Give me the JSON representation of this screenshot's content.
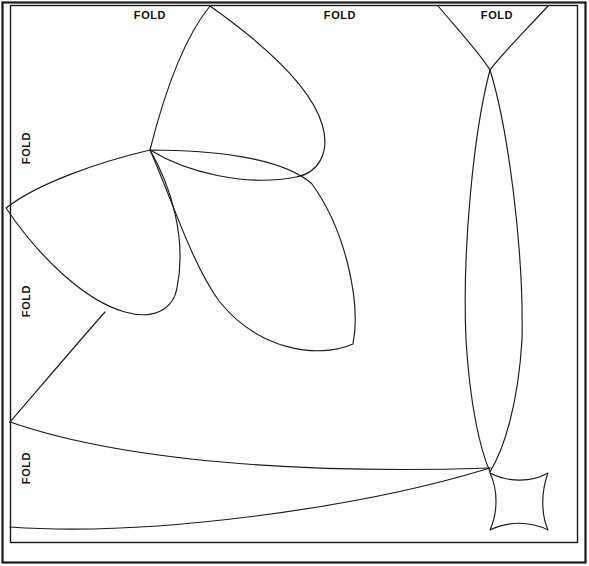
{
  "document": {
    "type": "quilt-applique-pattern-template",
    "title": "Folded pattern placement guide",
    "background_color": "#ffffff",
    "line_color": "#1a1a1a",
    "line_width": 1.1
  },
  "frame": {
    "outer": {
      "x": 2,
      "y": 2,
      "width": 584,
      "height": 561
    },
    "inner": {
      "x": 10,
      "y": 5,
      "width": 568,
      "height": 538
    }
  },
  "labels": {
    "fold_text": "FOLD",
    "top": [
      {
        "name": "fold-top-1",
        "text": "FOLD",
        "x": 150,
        "y": 10
      },
      {
        "name": "fold-top-2",
        "text": "FOLD",
        "x": 340,
        "y": 10
      },
      {
        "name": "fold-top-3",
        "text": "FOLD",
        "x": 497,
        "y": 10
      }
    ],
    "left": [
      {
        "name": "fold-left-1",
        "text": "FOLD",
        "x": 21,
        "y": 148
      },
      {
        "name": "fold-left-2",
        "text": "FOLD",
        "x": 21,
        "y": 301
      },
      {
        "name": "fold-left-3",
        "text": "FOLD",
        "x": 21,
        "y": 468
      }
    ]
  },
  "shapes": {
    "center_node": {
      "x": 150,
      "y": 150
    },
    "right_node": {
      "x": 490,
      "y": 70
    },
    "lower_right_node": {
      "x": 488,
      "y": 472
    },
    "petal_upper": "M150,150 C163,96 183,38 210,6 C258,40 310,84 322,124 C330,152 318,172 296,176 C246,186 186,172 150,150 Z",
    "petal_lower_left": "M150,150 C96,162 36,184 6,208 C38,256 84,300 124,312 C152,320 172,310 176,288 C186,240 172,186 150,150 Z",
    "petal_lower_right": "M150,150 C170,196 190,262 218,300 C258,350 318,358 352,344 C360,304 346,232 312,184 C282,158 210,150 150,150 Z",
    "left_sweep": "M105,312 C74,346 36,392 10,422",
    "leaf_upper": "M10,422 C140,466 340,472 490,468",
    "leaf_lower": "M10,527 C150,536 360,508 490,468",
    "right_lens_left": "M438,6 C462,34 482,56 490,70 C474,130 462,248 466,340 C470,404 480,448 490,472",
    "right_lens_right": "M548,6 C524,32 500,56 490,70 C508,128 524,250 522,340 C518,404 504,448 490,472",
    "curved_square": "M490,473 C508,482 532,481 548,473 C541,492 541,514 548,529 C530,521 508,521 490,529 C498,512 498,490 490,473 Z"
  },
  "legend": {
    "description": "Line-art quilt block placement diagram with FOLD markings along the top and left edges"
  }
}
